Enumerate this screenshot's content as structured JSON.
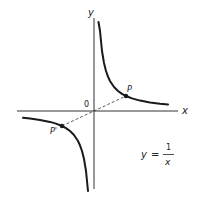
{
  "figure": {
    "type": "function-graph",
    "equation": {
      "lhs": "y",
      "equals": "=",
      "numerator": "1",
      "denominator": "x"
    },
    "axes": {
      "x_label": "x",
      "y_label": "y",
      "origin_label": "0"
    },
    "points": [
      {
        "label": "P",
        "quadrant": "first"
      },
      {
        "label": "P'",
        "quadrant": "third"
      }
    ],
    "segment": {
      "from": "P'",
      "to": "P",
      "style": "dashed",
      "through": "0"
    },
    "colors": {
      "curve": "#1a1a1a",
      "axis": "#333333",
      "text": "#222222",
      "background": "#ffffff"
    }
  }
}
